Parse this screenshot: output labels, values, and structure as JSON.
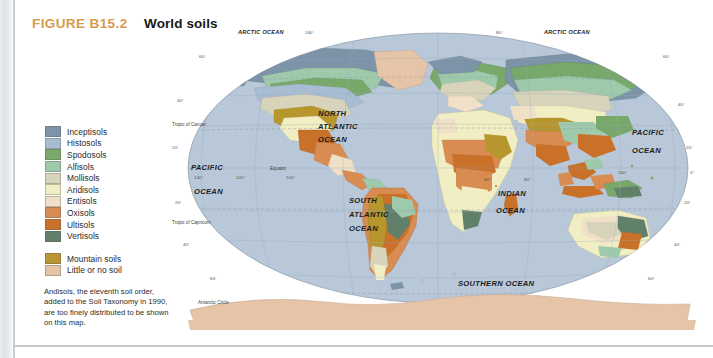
{
  "figure": {
    "number": "FIGURE B15.2",
    "title": "World soils"
  },
  "legend": {
    "soil_orders": [
      {
        "label": "Inceptisols",
        "color": "#7c93a8"
      },
      {
        "label": "Histosols",
        "color": "#a9bdd2"
      },
      {
        "label": "Spodosols",
        "color": "#7aa96b"
      },
      {
        "label": "Alfisols",
        "color": "#9fc9ab"
      },
      {
        "label": "Mollisols",
        "color": "#d8d4bc"
      },
      {
        "label": "Aridisols",
        "color": "#f2eec4"
      },
      {
        "label": "Entisols",
        "color": "#f0e0c8"
      },
      {
        "label": "Oxisols",
        "color": "#d98c52"
      },
      {
        "label": "Ultisols",
        "color": "#c9712a"
      },
      {
        "label": "Vertisols",
        "color": "#62806a"
      }
    ],
    "extra": [
      {
        "label": "Mountain soils",
        "color": "#b9962f"
      },
      {
        "label": "Little or no soil",
        "color": "#e6c4a8"
      }
    ],
    "note": "Andisols, the eleventh soil order, added to the Soil Taxonomy in 1990, are too finely distributed to be shown on this map."
  },
  "map": {
    "ocean_color": "#b8c8d8",
    "ocean_labels": [
      {
        "name": "arctic-ocean-left",
        "text": "ARCTIC OCEAN",
        "x": 72,
        "y": 16,
        "size": "sm"
      },
      {
        "name": "arctic-ocean-right",
        "text": "ARCTIC OCEAN",
        "x": 378,
        "y": 16,
        "size": "sm"
      },
      {
        "name": "north-atlantic-line1",
        "text": "NORTH",
        "x": 152,
        "y": 98,
        "size": "lg"
      },
      {
        "name": "north-atlantic-line2",
        "text": "ATLANTIC",
        "x": 152,
        "y": 111,
        "size": "lg"
      },
      {
        "name": "north-atlantic-line3",
        "text": "OCEAN",
        "x": 152,
        "y": 124,
        "size": "lg"
      },
      {
        "name": "pacific-ocean-left-l1",
        "text": "PACIFIC",
        "x": 25,
        "y": 152,
        "size": "lg"
      },
      {
        "name": "pacific-ocean-left-l2",
        "text": "OCEAN",
        "x": 28,
        "y": 176,
        "size": "lg"
      },
      {
        "name": "pacific-ocean-right-l1",
        "text": "PACIFIC",
        "x": 466,
        "y": 117,
        "size": "lg"
      },
      {
        "name": "pacific-ocean-right-l2",
        "text": "OCEAN",
        "x": 466,
        "y": 135,
        "size": "lg"
      },
      {
        "name": "south-atlantic-l1",
        "text": "SOUTH",
        "x": 183,
        "y": 185,
        "size": "lg"
      },
      {
        "name": "south-atlantic-l2",
        "text": "ATLANTIC",
        "x": 183,
        "y": 199,
        "size": "lg"
      },
      {
        "name": "south-atlantic-l3",
        "text": "OCEAN",
        "x": 183,
        "y": 213,
        "size": "lg"
      },
      {
        "name": "indian-ocean-l1",
        "text": "INDIAN",
        "x": 332,
        "y": 178,
        "size": "lg"
      },
      {
        "name": "indian-ocean-l2",
        "text": "OCEAN",
        "x": 330,
        "y": 195,
        "size": "lg"
      },
      {
        "name": "southern-ocean",
        "text": "SOUTHERN OCEAN",
        "x": 292,
        "y": 268,
        "size": "lg"
      }
    ],
    "reference_lines": [
      {
        "name": "tropic-of-cancer",
        "text": "Tropic of Cancer",
        "x": 6,
        "y": 108
      },
      {
        "name": "equator",
        "text": "Equator",
        "x": 104,
        "y": 152
      },
      {
        "name": "tropic-of-capricorn",
        "text": "Tropic of Capricorn",
        "x": 6,
        "y": 206
      },
      {
        "name": "antarctic-circle",
        "text": "Antarctic Circle",
        "x": 32,
        "y": 286
      }
    ],
    "graticule_labels": [
      {
        "text": "60°",
        "x": 33,
        "y": 40
      },
      {
        "text": "40°",
        "x": 11,
        "y": 84
      },
      {
        "text": "20°",
        "x": 6,
        "y": 131
      },
      {
        "text": "20°",
        "x": 9,
        "y": 186
      },
      {
        "text": "40°",
        "x": 17,
        "y": 228
      },
      {
        "text": "60°",
        "x": 44,
        "y": 262
      },
      {
        "text": "60°",
        "x": 497,
        "y": 40
      },
      {
        "text": "40°",
        "x": 512,
        "y": 88
      },
      {
        "text": "20°",
        "x": 520,
        "y": 131
      },
      {
        "text": "0°",
        "x": 524,
        "y": 156
      },
      {
        "text": "20°",
        "x": 518,
        "y": 186
      },
      {
        "text": "40°",
        "x": 508,
        "y": 228
      },
      {
        "text": "60°",
        "x": 482,
        "y": 262
      },
      {
        "text": "140°",
        "x": 28,
        "y": 161
      },
      {
        "text": "120°",
        "x": 70,
        "y": 161
      },
      {
        "text": "100°",
        "x": 120,
        "y": 161
      },
      {
        "text": "60°",
        "x": 318,
        "y": 163
      },
      {
        "text": "80°",
        "x": 358,
        "y": 163
      },
      {
        "text": "160°",
        "x": 452,
        "y": 156
      },
      {
        "text": "160°",
        "x": 139,
        "y": 16
      },
      {
        "text": "80°",
        "x": 330,
        "y": 16
      }
    ]
  }
}
